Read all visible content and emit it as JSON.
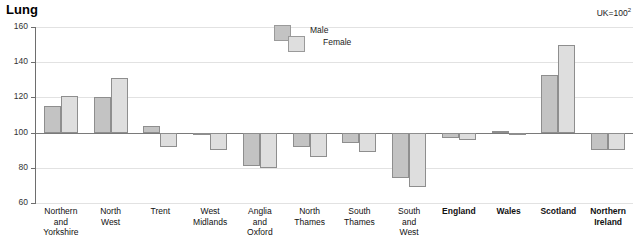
{
  "chart": {
    "title": "Lung",
    "note": "UK=100",
    "note_superscript": "2"
  },
  "legend": {
    "position": "top-center",
    "items": [
      {
        "label": "Male",
        "color": "#c3c3c3"
      },
      {
        "label": "Female",
        "color": "#dedede"
      }
    ]
  },
  "axis": {
    "y_ticks": [
      "160",
      "140",
      "120",
      "100",
      "80",
      "60"
    ]
  },
  "chart_data": {
    "type": "bar",
    "title": "Lung",
    "subtitle": "UK=100",
    "xlabel": "",
    "ylabel": "",
    "ylim": [
      60,
      160
    ],
    "yticks": [
      60,
      80,
      100,
      120,
      140,
      160
    ],
    "grid": true,
    "baseline": 100,
    "legend_position": "top-center",
    "categories": [
      "Northern and Yorkshire",
      "North West",
      "Trent",
      "West Midlands",
      "Anglia and Oxford",
      "North Thames",
      "South Thames",
      "South and West",
      "England",
      "Wales",
      "Scotland",
      "Northern Ireland"
    ],
    "series": [
      {
        "name": "Male",
        "color": "#c3c3c3",
        "values": [
          115,
          120,
          104,
          99,
          81,
          92,
          94,
          74,
          97,
          101,
          133,
          90
        ]
      },
      {
        "name": "Female",
        "color": "#dedede",
        "values": [
          121,
          131,
          92,
          90,
          80,
          86,
          89,
          69,
          96,
          100,
          150,
          90
        ]
      }
    ]
  },
  "categories_display": [
    {
      "lines": [
        "Northern",
        "and",
        "Yorkshire"
      ],
      "bold": false
    },
    {
      "lines": [
        "North",
        "West"
      ],
      "bold": false
    },
    {
      "lines": [
        "Trent"
      ],
      "bold": false
    },
    {
      "lines": [
        "West",
        "Midlands"
      ],
      "bold": false
    },
    {
      "lines": [
        "Anglia",
        "and",
        "Oxford"
      ],
      "bold": false
    },
    {
      "lines": [
        "North",
        "Thames"
      ],
      "bold": false
    },
    {
      "lines": [
        "South",
        "Thames"
      ],
      "bold": false
    },
    {
      "lines": [
        "South",
        "and",
        "West"
      ],
      "bold": false
    },
    {
      "lines": [
        "England"
      ],
      "bold": true
    },
    {
      "lines": [
        "Wales"
      ],
      "bold": true
    },
    {
      "lines": [
        "Scotland"
      ],
      "bold": true
    },
    {
      "lines": [
        "Northern",
        "Ireland"
      ],
      "bold": true
    }
  ]
}
